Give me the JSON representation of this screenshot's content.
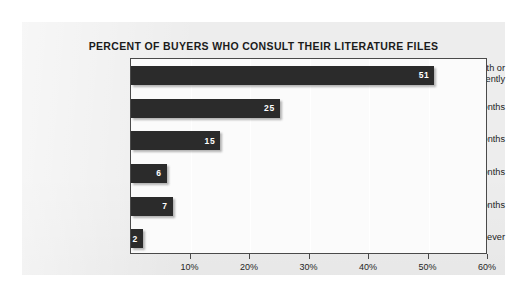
{
  "chart_data": {
    "type": "bar",
    "orientation": "horizontal",
    "title": "PERCENT OF BUYERS WHO CONSULT THEIR LITERATURE FILES",
    "xlabel": "",
    "ylabel": "",
    "categories": [
      "Once a Month or More Frequently",
      "Every 3 Months",
      "Every 6 Months",
      "Every 12 Months",
      "Every 18 Months",
      "Never"
    ],
    "category_lines": [
      [
        "Once a Month or",
        "More Frequently"
      ],
      [
        "Every 3 Months"
      ],
      [
        "Every 6 Months"
      ],
      [
        "Every 12 Months"
      ],
      [
        "Every 18 Months"
      ],
      [
        "Never"
      ]
    ],
    "values": [
      51,
      25,
      15,
      6,
      7,
      2
    ],
    "value_labels": [
      "51",
      "25",
      "15",
      "6",
      "7",
      "2"
    ],
    "xlim": [
      0,
      60
    ],
    "xtick_values": [
      0,
      10,
      20,
      30,
      40,
      50,
      60
    ],
    "xtick_labels": [
      "",
      "10%",
      "20%",
      "30%",
      "40%",
      "50%",
      "60%"
    ],
    "grid": true,
    "grid_axis": "x",
    "legend": false,
    "bar_color": "#2b2b2b",
    "value_label_color": "#ffffff",
    "plot_background": "#fbfbfb",
    "panel_background": "#ededed",
    "axis_color": "#4a4a4a"
  }
}
